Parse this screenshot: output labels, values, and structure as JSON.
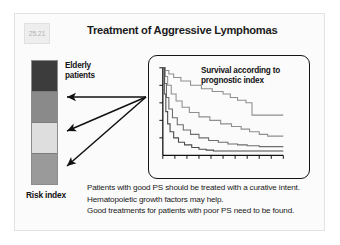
{
  "slide": {
    "number": "25.21",
    "title": "Treatment of Aggressive Lymphomas"
  },
  "risk_index": {
    "elderly_label_line1": "Elderly",
    "elderly_label_line2": "patients",
    "axis_label": "Risk index",
    "segments": [
      {
        "name": "high-risk",
        "color": "#3c3c3c"
      },
      {
        "name": "high-intermediate-risk",
        "color": "#8a8a8a"
      },
      {
        "name": "low-intermediate-risk",
        "color": "#dedede"
      },
      {
        "name": "low-risk",
        "color": "#9a9a9a"
      }
    ]
  },
  "chart": {
    "caption_line1": "Survival according to",
    "caption_line2": "prognostic index"
  },
  "chart_data": {
    "type": "line",
    "title": "Survival according to prognostic index",
    "xlabel": "",
    "ylabel": "",
    "xlim": [
      0,
      10
    ],
    "ylim": [
      0,
      1
    ],
    "grid": false,
    "legend": "none",
    "x_ticks": [
      0,
      1,
      2,
      3,
      4,
      5,
      6,
      7,
      8,
      9,
      10
    ],
    "series": [
      {
        "name": "low risk",
        "color": "#8f8f8f",
        "x": [
          0.0,
          0.2,
          0.5,
          0.9,
          1.5,
          2.3,
          3.2,
          4.1,
          5.0,
          5.6,
          6.2,
          6.9,
          7.4,
          7.4,
          8.6,
          10.0
        ],
        "y": [
          1.0,
          0.97,
          0.93,
          0.89,
          0.85,
          0.8,
          0.76,
          0.73,
          0.7,
          0.66,
          0.63,
          0.6,
          0.58,
          0.46,
          0.46,
          0.46
        ]
      },
      {
        "name": "low-intermediate risk",
        "color": "#8f8f8f",
        "x": [
          0.0,
          0.2,
          0.4,
          0.7,
          1.1,
          1.6,
          2.2,
          3.0,
          3.9,
          4.8,
          5.7,
          6.5,
          7.2,
          8.0,
          8.7,
          10.0
        ],
        "y": [
          1.0,
          0.9,
          0.8,
          0.7,
          0.62,
          0.55,
          0.49,
          0.44,
          0.4,
          0.36,
          0.33,
          0.3,
          0.27,
          0.24,
          0.22,
          0.22
        ]
      },
      {
        "name": "high-intermediate risk",
        "color": "#6e6e6e",
        "x": [
          0.0,
          0.15,
          0.3,
          0.5,
          0.8,
          1.2,
          1.7,
          2.3,
          3.0,
          3.8,
          4.6,
          5.4,
          6.2,
          7.0,
          8.0,
          10.0
        ],
        "y": [
          1.0,
          0.82,
          0.66,
          0.53,
          0.43,
          0.35,
          0.29,
          0.24,
          0.2,
          0.17,
          0.15,
          0.13,
          0.12,
          0.11,
          0.1,
          0.1
        ]
      },
      {
        "name": "high risk",
        "color": "#4a4a4a",
        "x": [
          0.0,
          0.12,
          0.25,
          0.4,
          0.6,
          0.9,
          1.3,
          1.8,
          2.4,
          3.0,
          3.6,
          4.2,
          4.8,
          5.4,
          6.0,
          10.0
        ],
        "y": [
          1.0,
          0.7,
          0.5,
          0.36,
          0.27,
          0.2,
          0.15,
          0.12,
          0.09,
          0.07,
          0.06,
          0.05,
          0.05,
          0.05,
          0.05,
          0.05
        ]
      }
    ]
  },
  "body_text": {
    "line1": "Patients with good PS should be treated with a curative intent.",
    "line2": "Hematopoietic growth factors may help.",
    "line3": "Good treatments for patients with poor PS need to be found."
  }
}
